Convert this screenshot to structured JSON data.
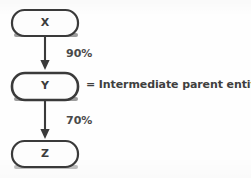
{
  "figure": {
    "background_color": "#fefefe",
    "stroke_color": "#3a3a3a"
  },
  "nodes": [
    {
      "id": "x",
      "label": "X",
      "shape": "rounded-rectangle"
    },
    {
      "id": "y",
      "label": "Y",
      "shape": "rounded-rectangle"
    },
    {
      "id": "z",
      "label": "Z",
      "shape": "rounded-rectangle"
    }
  ],
  "edges": [
    {
      "id": "edge-1",
      "from": "X",
      "to": "Y",
      "label": "90%",
      "arrow": "down"
    },
    {
      "id": "edge-2",
      "from": "Y",
      "to": "Z",
      "label": "70%",
      "arrow": "down"
    }
  ],
  "legend": {
    "symbol": "=",
    "text": "= Intermediate parent entity",
    "refers_to": "Y"
  }
}
